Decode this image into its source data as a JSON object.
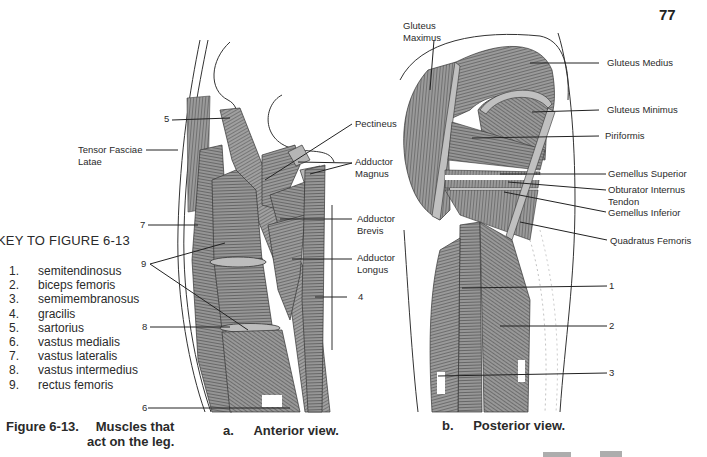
{
  "page": {
    "page_number": "77"
  },
  "figure": {
    "caption_number": "Figure 6-13.",
    "caption_line1": "Muscles that",
    "caption_line2": "act on the leg.",
    "anterior_caption_letter": "a.",
    "anterior_caption_text": "Anterior view.",
    "posterior_caption_letter": "b.",
    "posterior_caption_text": "Posterior view."
  },
  "key": {
    "title": "KEY TO FIGURE 6-13",
    "items": [
      {
        "num": "1.",
        "label": "semitendinosus"
      },
      {
        "num": "2.",
        "label": "biceps femoris"
      },
      {
        "num": "3.",
        "label": "semimembranosus"
      },
      {
        "num": "4.",
        "label": "gracilis"
      },
      {
        "num": "5.",
        "label": "sartorius"
      },
      {
        "num": "6.",
        "label": "vastus medialis"
      },
      {
        "num": "7.",
        "label": "vastus lateralis"
      },
      {
        "num": "8.",
        "label": "vastus intermedius"
      },
      {
        "num": "9.",
        "label": "rectus femoris"
      }
    ]
  },
  "anterior_labels": {
    "tensor_line1": "Tensor Fasciae",
    "tensor_line2": "Latae",
    "pectineus": "Pectineus",
    "adductor_magnus_line1": "Adductor",
    "adductor_magnus_line2": "Magnus",
    "adductor_brevis_line1": "Adductor",
    "adductor_brevis_line2": "Brevis",
    "adductor_longus_line1": "Adductor",
    "adductor_longus_line2": "Longus",
    "n4": "4",
    "n5": "5",
    "n6": "6",
    "n7": "7",
    "n8": "8",
    "n9": "9"
  },
  "posterior_labels": {
    "gluteus_maximus_line1": "Gluteus",
    "gluteus_maximus_line2": "Maximus",
    "gluteus_medius": "Gluteus Medius",
    "gluteus_minimus": "Gluteus Minimus",
    "piriformis": "Piriformis",
    "gemellus_superior": "Gemellus Superior",
    "obturator_line1": "Obturator Internus",
    "obturator_line2": "Tendon",
    "gemellus_inferior": "Gemellus Inferior",
    "quadratus_femoris": "Quadratus Femoris",
    "n1": "1",
    "n2": "2",
    "n3": "3"
  },
  "colors": {
    "ink": "#2a2a2a",
    "muscle_fill": "#8a8a8a",
    "paper": "#ffffff"
  }
}
